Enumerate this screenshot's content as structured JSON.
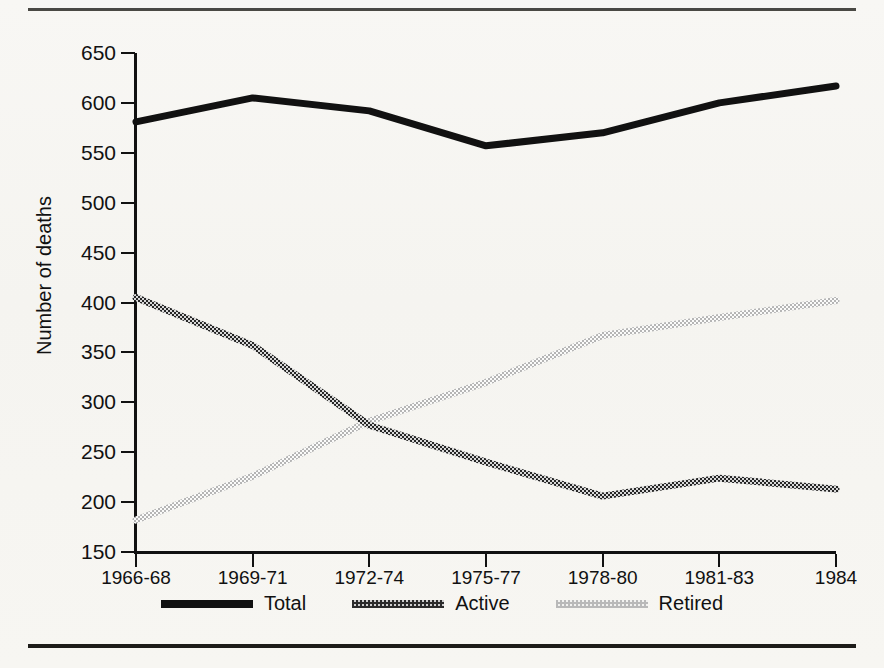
{
  "figure": {
    "ytitle": "Number of deaths"
  },
  "legend": [
    {
      "label": "Total",
      "key": "total",
      "color": "#111111"
    },
    {
      "label": "Active",
      "key": "active",
      "color": "#3a3a3a"
    },
    {
      "label": "Retired",
      "key": "retired",
      "color": "#bdbdbd"
    }
  ],
  "chart_data": {
    "type": "line",
    "title": "",
    "xlabel": "",
    "ylabel": "Number of deaths",
    "categories": [
      "1966-68",
      "1969-71",
      "1972-74",
      "1975-77",
      "1978-80",
      "1981-83",
      "1984"
    ],
    "yticks": [
      150,
      200,
      250,
      300,
      350,
      400,
      450,
      500,
      550,
      600,
      650
    ],
    "ylim": [
      150,
      650
    ],
    "grid": false,
    "legend_position": "bottom",
    "series": [
      {
        "name": "Total",
        "style": "solid-thick",
        "color": "#111111",
        "values": [
          581,
          605,
          592,
          557,
          570,
          600,
          617
        ]
      },
      {
        "name": "Active",
        "style": "dotted-dark",
        "color": "#3a3a3a",
        "values": [
          405,
          357,
          277,
          240,
          206,
          224,
          213
        ]
      },
      {
        "name": "Retired",
        "style": "dotted-light",
        "color": "#bdbdbd",
        "values": [
          182,
          226,
          281,
          320,
          367,
          385,
          402
        ]
      }
    ]
  }
}
